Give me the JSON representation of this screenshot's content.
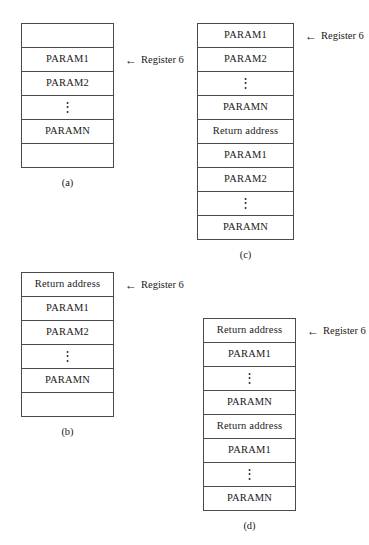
{
  "figures": [
    {
      "id": "a",
      "caption": "(a)",
      "left": 21,
      "top": 23,
      "width": 93,
      "row_height": 24,
      "callout": {
        "arrow": "←",
        "label": "Register 6",
        "row_index": 1
      },
      "rows": [
        {
          "text": "",
          "kind": "blank"
        },
        {
          "text": "PARAM1",
          "kind": "text"
        },
        {
          "text": "PARAM2",
          "kind": "text"
        },
        {
          "text": "⋮",
          "kind": "vdots"
        },
        {
          "text": "PARAMN",
          "kind": "text"
        },
        {
          "text": "",
          "kind": "blank"
        }
      ]
    },
    {
      "id": "b",
      "caption": "(b)",
      "left": 21,
      "top": 272,
      "width": 93,
      "row_height": 24,
      "callout": {
        "arrow": "←",
        "label": "Register 6",
        "row_index": 0
      },
      "rows": [
        {
          "text": "Return address",
          "kind": "text"
        },
        {
          "text": "PARAM1",
          "kind": "text"
        },
        {
          "text": "PARAM2",
          "kind": "text"
        },
        {
          "text": "⋮",
          "kind": "vdots"
        },
        {
          "text": "PARAMN",
          "kind": "text"
        },
        {
          "text": "",
          "kind": "blank"
        }
      ]
    },
    {
      "id": "c",
      "caption": "(c)",
      "left": 197,
      "top": 23,
      "width": 97,
      "row_height": 24,
      "callout": {
        "arrow": "←",
        "label": "Register 6",
        "row_index": 0
      },
      "rows": [
        {
          "text": "PARAM1",
          "kind": "text"
        },
        {
          "text": "PARAM2",
          "kind": "text"
        },
        {
          "text": "⋮",
          "kind": "vdots"
        },
        {
          "text": "PARAMN",
          "kind": "text"
        },
        {
          "text": "Return address",
          "kind": "text"
        },
        {
          "text": "PARAM1",
          "kind": "text"
        },
        {
          "text": "PARAM2",
          "kind": "text"
        },
        {
          "text": "⋮",
          "kind": "vdots"
        },
        {
          "text": "PARAMN",
          "kind": "text"
        }
      ]
    },
    {
      "id": "d",
      "caption": "(d)",
      "left": 203,
      "top": 318,
      "width": 93,
      "row_height": 24,
      "callout": {
        "arrow": "←",
        "label": "Register 6",
        "row_index": 0
      },
      "rows": [
        {
          "text": "Return address",
          "kind": "text"
        },
        {
          "text": "PARAM1",
          "kind": "text"
        },
        {
          "text": "⋮",
          "kind": "vdots"
        },
        {
          "text": "PARAMN",
          "kind": "text"
        },
        {
          "text": "Return address",
          "kind": "text"
        },
        {
          "text": "PARAM1",
          "kind": "text"
        },
        {
          "text": "⋮",
          "kind": "vdots"
        },
        {
          "text": "PARAMN",
          "kind": "text"
        }
      ]
    }
  ]
}
